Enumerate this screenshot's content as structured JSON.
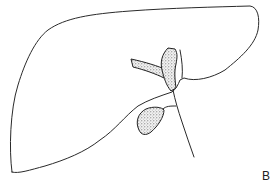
{
  "figure": {
    "panel_label": "B",
    "parts": [
      {
        "name": "liver-outline",
        "fill": "none"
      },
      {
        "name": "lobe-cleft",
        "fill": "none"
      },
      {
        "name": "left-hepatic-duct",
        "fill": "stippled"
      },
      {
        "name": "right-hepatic-duct",
        "fill": "stippled"
      },
      {
        "name": "gallbladder",
        "fill": "stippled"
      },
      {
        "name": "cystic-duct",
        "fill": "none"
      },
      {
        "name": "common-bile-duct",
        "fill": "none"
      }
    ],
    "colors": {
      "line": "#2a2a2a",
      "background": "#ffffff",
      "stipple": "#555555"
    }
  }
}
